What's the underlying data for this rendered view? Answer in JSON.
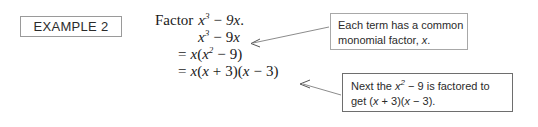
{
  "example": {
    "label": "EXAMPLE 2"
  },
  "solution": {
    "prompt_word": "Factor",
    "prompt_expr": {
      "base": "x",
      "exponent": "3",
      "minus": "−",
      "term": "9x",
      "period": "."
    },
    "steps": [
      {
        "id": "step-original",
        "text": "x³ − 9x"
      },
      {
        "id": "step-common-factor",
        "text": "= x(x² − 9)"
      },
      {
        "id": "step-difference-of-squares",
        "text": "= x(x + 3)(x − 3)"
      }
    ]
  },
  "callouts": [
    {
      "id": "callout-common-monomial",
      "line1_a": "Each term has a common",
      "line2_a": "monomial factor,",
      "line2_var": "x",
      "line2_b": "."
    },
    {
      "id": "callout-factor-difference",
      "line1_a": "Next the",
      "line1_var": "x",
      "line1_exp": "2",
      "line1_b": "− 9 is factored to",
      "line2_a": "get (",
      "line2_var1": "x",
      "line2_b": "+ 3)(",
      "line2_var2": "x",
      "line2_c": "− 3)."
    }
  ],
  "colors": {
    "text": "#1a1a1a",
    "callout_border_light": "#a8a8a8",
    "callout_border_dark": "#6e6e6e",
    "example_border": "#9a9a9a",
    "leader_line": "#8c8c8c",
    "background": "#ffffff"
  }
}
